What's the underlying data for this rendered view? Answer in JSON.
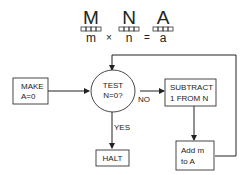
{
  "header": {
    "registers": [
      {
        "letter": "M",
        "var": "m"
      },
      {
        "letter": "N",
        "var": "n"
      },
      {
        "letter": "A",
        "var": "a"
      }
    ],
    "times": "×",
    "equals": "="
  },
  "flowchart": {
    "make": {
      "line1": "MAKE",
      "line2": "A=0"
    },
    "test": {
      "line1": "TEST",
      "line2": "N=0?"
    },
    "subtract": {
      "line1": "SUBTRACT",
      "line2": "1 FROM N"
    },
    "add": {
      "line1": "Add m",
      "line2": "to A"
    },
    "halt": {
      "label": "HALT"
    },
    "no_label": "NO",
    "yes_label": "YES"
  }
}
